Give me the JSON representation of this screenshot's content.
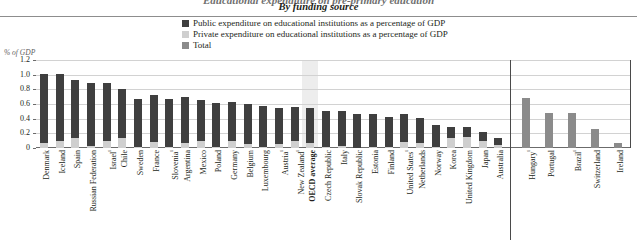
{
  "header": {
    "title_cut": "Educational expenditure on pre-primary education",
    "subtitle": "By funding source"
  },
  "legend": {
    "items": [
      {
        "label": "Public expenditure on educational institutions as a percentage of GDP",
        "swatch": "public",
        "color": "#3f3f3f"
      },
      {
        "label": "Private expenditure on educational institutions as a percentage of GDP",
        "swatch": "private",
        "color": "#cfcfcf"
      },
      {
        "label": "Total",
        "swatch": "total",
        "color": "#8b8b8b"
      }
    ]
  },
  "axis": {
    "y_title": "% of GDP",
    "y_ticks": [
      "1.2",
      "1.0",
      "0.8",
      "0.6",
      "0.4",
      "0.2",
      "0"
    ]
  },
  "chart_data": {
    "type": "bar",
    "title": "By funding source",
    "xlabel": "",
    "ylabel": "% of GDP",
    "ylim": [
      0,
      1.2
    ],
    "grid": true,
    "legend_position": "top-center",
    "stacked": true,
    "series": [
      {
        "name": "Public expenditure on educational institutions as a percentage of GDP",
        "color": "#3f3f3f"
      },
      {
        "name": "Private expenditure on educational institutions as a percentage of GDP",
        "color": "#cfcfcf"
      },
      {
        "name": "Total",
        "color": "#8b8b8b"
      }
    ],
    "groups": [
      {
        "name": "By funding source (public and private split)",
        "categories": [
          "Denmark",
          "Iceland",
          "Spain",
          "Russian Federation",
          "Israel¹",
          "Chile",
          "Sweden",
          "France",
          "Slovenia¹",
          "Argentina",
          "Mexico",
          "Poland",
          "Germany",
          "Belgium",
          "Luxembourg",
          "Austria¹",
          "New Zealand¹",
          "OECD average",
          "Czech Republic",
          "Italy",
          "Slovak Republic",
          "Estonia",
          "Finland",
          "United States¹",
          "Netherlands",
          "Norway",
          "Korea",
          "United Kingdom",
          "Japan",
          "Australia"
        ],
        "public": [
          0.94,
          0.91,
          0.8,
          0.85,
          0.79,
          0.68,
          0.65,
          0.64,
          0.65,
          0.62,
          0.56,
          0.6,
          0.53,
          0.54,
          0.55,
          0.49,
          0.46,
          0.48,
          0.48,
          0.47,
          0.47,
          0.45,
          0.4,
          0.38,
          0.34,
          0.3,
          0.16,
          0.14,
          0.13,
          0.09
        ],
        "private": [
          0.07,
          0.1,
          0.13,
          0.03,
          0.09,
          0.13,
          0.02,
          0.08,
          0.02,
          0.07,
          0.09,
          0.02,
          0.1,
          0.06,
          0.02,
          0.06,
          0.1,
          0.07,
          0.02,
          0.03,
          0.0,
          0.02,
          0.02,
          0.08,
          0.07,
          0.02,
          0.13,
          0.15,
          0.09,
          0.04
        ]
      },
      {
        "name": "Total only",
        "categories": [
          "Hungary¹",
          "Portugal",
          "Brazil¹",
          "Switzerland",
          "Ireland"
        ],
        "total": [
          0.68,
          0.48,
          0.48,
          0.26,
          0.07
        ]
      }
    ],
    "highlight_category": "OECD average"
  }
}
